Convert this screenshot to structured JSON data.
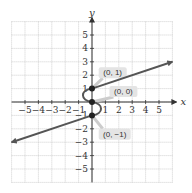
{
  "chart_data": {
    "type": "line",
    "title": "",
    "xlabel": "x",
    "ylabel": "y",
    "xlim": [
      -6,
      6
    ],
    "ylim": [
      -6,
      6
    ],
    "grid": true,
    "x_ticks": [
      -5,
      -4,
      -3,
      -2,
      -1,
      1,
      2,
      3,
      4,
      5
    ],
    "y_ticks": [
      -5,
      -4,
      -3,
      -2,
      -1,
      1,
      2,
      3,
      4,
      5
    ],
    "x_tick_labels": [
      "−5",
      "−4",
      "−3",
      "−2",
      "−1",
      "1",
      "2",
      "3",
      "4",
      "5"
    ],
    "y_tick_labels": [
      "−5",
      "−4",
      "−3",
      "−2",
      "−1",
      "1",
      "2",
      "3",
      "4",
      "5"
    ],
    "series": [
      {
        "name": "upper ray",
        "points": [
          [
            0,
            1
          ],
          [
            6,
            3
          ]
        ],
        "arrow_end": true
      },
      {
        "name": "S-curve",
        "points": [
          [
            0,
            1
          ],
          [
            -0.6,
            0.5
          ],
          [
            0,
            0
          ],
          [
            0.6,
            -0.5
          ],
          [
            0,
            -1
          ]
        ]
      },
      {
        "name": "lower ray",
        "points": [
          [
            0,
            -1
          ],
          [
            -6,
            -3
          ]
        ],
        "arrow_end": true
      }
    ],
    "marked_points": [
      {
        "x": 0,
        "y": 1,
        "label": "(0, 1)"
      },
      {
        "x": 0,
        "y": 0,
        "label": "(0, 0)"
      },
      {
        "x": 0,
        "y": -1,
        "label": "(0, −1)"
      }
    ],
    "colors": {
      "curve": "#555555",
      "axis": "#333333",
      "grid": "#bbbbbb",
      "callout_bg": "#e4e4e4",
      "point": "#222222"
    }
  }
}
